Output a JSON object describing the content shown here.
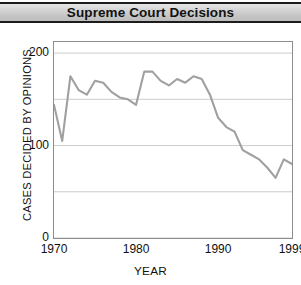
{
  "banner": {
    "title": "Supreme Court Decisions"
  },
  "chart_data": {
    "type": "line",
    "title": "Supreme Court Decisions",
    "xlabel": "YEAR",
    "ylabel": "CASES DECIDED BY OPINIONS",
    "xlim": [
      1970,
      1999
    ],
    "ylim": [
      0,
      212
    ],
    "grid": true,
    "legend": false,
    "line_color": "#a0a0a0",
    "frame_color": "#8d8d8d",
    "grid_color": "#cccccc",
    "xticks": [
      1970,
      1980,
      1990,
      1999
    ],
    "xtick_labels": [
      "1970",
      "1980",
      "1990",
      "1999"
    ],
    "yticks": [
      0,
      100,
      200
    ],
    "ytick_labels": [
      "0",
      "100",
      "200"
    ],
    "gridlines_y": [
      0,
      50,
      100,
      150,
      200
    ],
    "x": [
      1970,
      1971,
      1972,
      1973,
      1974,
      1975,
      1976,
      1977,
      1978,
      1979,
      1980,
      1981,
      1982,
      1983,
      1984,
      1985,
      1986,
      1987,
      1988,
      1989,
      1990,
      1991,
      1992,
      1993,
      1994,
      1995,
      1996,
      1997,
      1998,
      1999
    ],
    "values": [
      144,
      105,
      175,
      160,
      155,
      170,
      168,
      158,
      152,
      150,
      144,
      180,
      180,
      170,
      165,
      172,
      168,
      175,
      172,
      155,
      130,
      120,
      115,
      95,
      90,
      85,
      76,
      65,
      85,
      80
    ],
    "series": [
      {
        "name": "Cases decided by opinions",
        "values": [
          144,
          105,
          175,
          160,
          155,
          170,
          168,
          158,
          152,
          150,
          144,
          180,
          180,
          170,
          165,
          172,
          168,
          175,
          172,
          155,
          130,
          120,
          115,
          95,
          90,
          85,
          76,
          65,
          85,
          80
        ]
      }
    ]
  }
}
